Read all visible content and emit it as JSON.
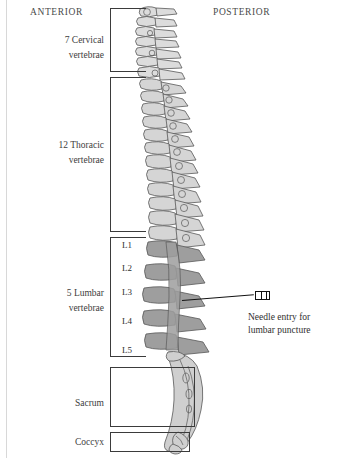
{
  "figure": {
    "background_color": "#ffffff"
  },
  "orientation": {
    "anterior": "ANTERIOR",
    "posterior": "POSTERIOR"
  },
  "regions": [
    {
      "id": "cervical",
      "line1": "7 Cervical",
      "line2": "vertebrae",
      "count": 7
    },
    {
      "id": "thoracic",
      "line1": "12 Thoracic",
      "line2": "vertebrae",
      "count": 12
    },
    {
      "id": "lumbar",
      "line1": "5 Lumbar",
      "line2": "vertebrae",
      "count": 5
    },
    {
      "id": "sacrum",
      "line1": "Sacrum",
      "line2": "",
      "count": 1
    },
    {
      "id": "coccyx",
      "line1": "Coccyx",
      "line2": "",
      "count": 1
    }
  ],
  "lumbar_vertebrae": [
    {
      "label": "L1"
    },
    {
      "label": "L2"
    },
    {
      "label": "L3"
    },
    {
      "label": "L4"
    },
    {
      "label": "L5"
    }
  ],
  "callout": {
    "line1": "Needle entry for",
    "line2": "lumbar puncture",
    "target_level": "L3",
    "icon": "needle-hub-icon"
  },
  "colors": {
    "outline": "#3b3b3b",
    "text": "#2f2f2f",
    "orientation_text": "#4a4a4a",
    "cervical_fill": "#dcdcdc",
    "thoracic_fill": "#d5d5d5",
    "lumbar_fill": "#9e9e9e",
    "sacrum_fill": "#cfcfcf",
    "needle": "#121212",
    "page_rule": "#d8d8d8"
  }
}
